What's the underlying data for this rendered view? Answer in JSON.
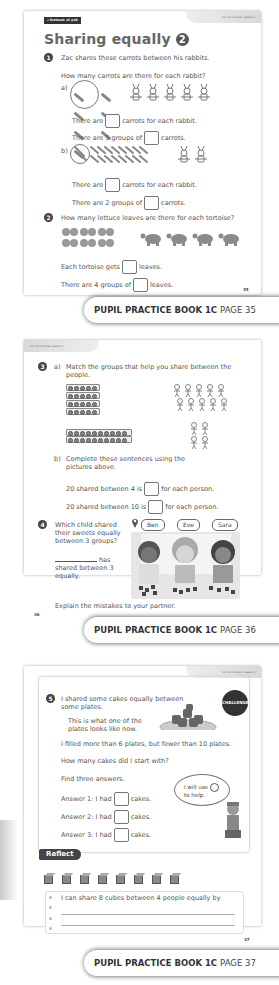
{
  "page1": {
    "textbook_badge": "◂ Textbook 1C p48",
    "unit_tag": "Unit 13: Division, Lesson 4",
    "title": "Sharing equally",
    "title_number": "2",
    "q1": {
      "number": "1",
      "line1": "Zac shares these carrots between his rabbits.",
      "line2": "How many carrots are there for each rabbit?",
      "part_a": {
        "label": "a)",
        "sentence1_before": "There are",
        "sentence1_after": "carrots for each rabbit.",
        "sentence2_before": "There are 5 groups of",
        "sentence2_after": "carrots.",
        "rabbit_count": 5
      },
      "part_b": {
        "label": "b)",
        "sentence1_before": "There are",
        "sentence1_after": "carrots for each rabbit.",
        "sentence2_before": "There are 2 groups of",
        "sentence2_after": "carrots.",
        "rabbit_count": 2
      }
    },
    "q2": {
      "number": "2",
      "line1": "How many lettuce leaves are there for each tortoise?",
      "sentence1_before": "Each tortoise gets",
      "sentence1_after": "leaves.",
      "sentence2_before": "There are 4 groups of",
      "sentence2_after": "leaves.",
      "tortoise_count": 4,
      "leaf_count": 12
    },
    "page_number": "35"
  },
  "banner1": {
    "book": "PUPIL PRACTICE BOOK 1C",
    "page": "PAGE 35"
  },
  "page2": {
    "unit_tag": "Unit 13: Division, Lesson 4",
    "q3": {
      "number": "3",
      "part_a_label": "a)",
      "part_a_text": "Match the groups that help you share between the people.",
      "part_b_label": "b)",
      "part_b_text": "Complete these sentences using the pictures above.",
      "sentence1_before": "20 shared between 4 is",
      "sentence1_after": "for each person.",
      "sentence2_before": "20 shared between 10 is",
      "sentence2_after": "for each person."
    },
    "q4": {
      "number": "4",
      "question": "Which child shared their sweets equally between 3 groups?",
      "answer_suffix": "has shared between 3 equally.",
      "names": [
        "Ben",
        "Eve",
        "Sara"
      ],
      "explain": "Explain the mistakes to your partner."
    },
    "page_number": "36"
  },
  "banner2": {
    "book": "PUPIL PRACTICE BOOK 1C",
    "page": "PAGE 36"
  },
  "page3": {
    "unit_tag": "Unit 13: Division, Lesson 4",
    "challenge_label": "CHALLENGE",
    "q5": {
      "number": "5",
      "line1": "I shared some cakes equally between some plates.",
      "line2": "This is what one of the plates looks like now.",
      "line3": "I filled more than 6 plates, but fewer than 10 plates.",
      "line4": "How many cakes did I start with?",
      "line5": "Find three answers.",
      "answers": [
        {
          "before": "Answer 1: I had",
          "after": "cakes."
        },
        {
          "before": "Answer 2: I had",
          "after": "cakes."
        },
        {
          "before": "Answer 3: I had",
          "after": "cakes."
        }
      ],
      "speech_line1": "I will use",
      "speech_line2": "to help."
    },
    "reflect": {
      "label": "Reflect",
      "cube_count": 8,
      "prompt": "I can share 8 cubes between 4 people equally by"
    },
    "page_number": "37"
  },
  "banner3": {
    "book": "PUPIL PRACTICE BOOK 1C",
    "page": "PAGE 37"
  }
}
